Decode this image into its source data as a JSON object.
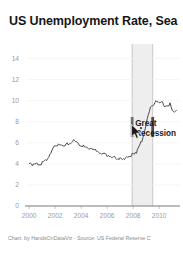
{
  "chart_title": "US Unemployment Rate, Sea",
  "footer": "Chart: by HandsOnDataViz · Source: US Federal Reserve C",
  "cursor": {
    "icon": "mouse-pointer-icon",
    "x": 131,
    "y": 124
  },
  "chart_data": {
    "type": "line",
    "title": "US Unemployment Rate, Sea",
    "xlabel": "",
    "ylabel": "",
    "xlim": [
      1999.6,
      2011.6
    ],
    "ylim": [
      0,
      15
    ],
    "grid": false,
    "legend": null,
    "x_ticks": [
      "2000",
      "2002",
      "2004",
      "2006",
      "2008",
      "2010"
    ],
    "x_tick_values": [
      2000,
      2002,
      2004,
      2006,
      2008,
      2010
    ],
    "y_ticks": [
      "0",
      "2",
      "4",
      "6",
      "8",
      "10",
      "12",
      "14"
    ],
    "y_tick_values": [
      0,
      2,
      4,
      6,
      8,
      10,
      12,
      14
    ],
    "annotations": [
      {
        "name": "great-recession-band",
        "label": "Great\nRecession",
        "label_line1": "Great",
        "label_line2": "Recession",
        "x_start": 2007.92,
        "x_end": 2009.5,
        "fill": "#eeeeee",
        "border": "#aaaaaa"
      }
    ],
    "handles": [
      {
        "name": "band-left-handle",
        "x": 2007.92,
        "y": 7.5,
        "color": "#6f6f6f"
      },
      {
        "name": "band-right-handle",
        "x": 2009.5,
        "y": 7.5,
        "color": "#4a4a4a"
      }
    ],
    "marker_dot": {
      "x": 2008.6,
      "y": 7.4,
      "color": "#3a3a3a"
    },
    "series": [
      {
        "name": "US Unemployment Rate",
        "color": "#4d4d4d",
        "x": [
          2000.0,
          2000.08,
          2000.17,
          2000.25,
          2000.33,
          2000.42,
          2000.5,
          2000.58,
          2000.67,
          2000.75,
          2000.83,
          2000.92,
          2001.0,
          2001.08,
          2001.17,
          2001.25,
          2001.33,
          2001.42,
          2001.5,
          2001.58,
          2001.67,
          2001.75,
          2001.83,
          2001.92,
          2002.0,
          2002.08,
          2002.17,
          2002.25,
          2002.33,
          2002.42,
          2002.5,
          2002.58,
          2002.67,
          2002.75,
          2002.83,
          2002.92,
          2003.0,
          2003.08,
          2003.17,
          2003.25,
          2003.33,
          2003.42,
          2003.5,
          2003.58,
          2003.67,
          2003.75,
          2003.83,
          2003.92,
          2004.0,
          2004.08,
          2004.17,
          2004.25,
          2004.33,
          2004.42,
          2004.5,
          2004.58,
          2004.67,
          2004.75,
          2004.83,
          2004.92,
          2005.0,
          2005.08,
          2005.17,
          2005.25,
          2005.33,
          2005.42,
          2005.5,
          2005.58,
          2005.67,
          2005.75,
          2005.83,
          2005.92,
          2006.0,
          2006.08,
          2006.17,
          2006.25,
          2006.33,
          2006.42,
          2006.5,
          2006.58,
          2006.67,
          2006.75,
          2006.83,
          2006.92,
          2007.0,
          2007.08,
          2007.17,
          2007.25,
          2007.33,
          2007.42,
          2007.5,
          2007.58,
          2007.67,
          2007.75,
          2007.83,
          2007.92,
          2008.0,
          2008.08,
          2008.17,
          2008.25,
          2008.33,
          2008.42,
          2008.5,
          2008.58,
          2008.67,
          2008.75,
          2008.83,
          2008.92,
          2009.0,
          2009.08,
          2009.17,
          2009.25,
          2009.33,
          2009.42,
          2009.5,
          2009.58,
          2009.67,
          2009.75,
          2009.83,
          2009.92,
          2010.0,
          2010.08,
          2010.17,
          2010.25,
          2010.33,
          2010.42,
          2010.5,
          2010.58,
          2010.67,
          2010.75,
          2010.83,
          2010.92,
          2011.0,
          2011.08,
          2011.17,
          2011.25,
          2011.33
        ],
        "y": [
          4.0,
          4.1,
          4.0,
          3.8,
          4.0,
          4.0,
          4.0,
          4.1,
          3.9,
          3.9,
          3.9,
          3.9,
          4.2,
          4.2,
          4.3,
          4.4,
          4.3,
          4.5,
          4.6,
          4.9,
          5.0,
          5.3,
          5.5,
          5.7,
          5.7,
          5.7,
          5.7,
          5.9,
          5.8,
          5.8,
          5.8,
          5.7,
          5.7,
          5.7,
          5.9,
          6.0,
          5.8,
          5.9,
          5.9,
          6.0,
          6.1,
          6.3,
          6.2,
          6.1,
          6.1,
          6.0,
          5.8,
          5.7,
          5.7,
          5.6,
          5.8,
          5.6,
          5.6,
          5.6,
          5.5,
          5.4,
          5.4,
          5.5,
          5.4,
          5.4,
          5.3,
          5.4,
          5.2,
          5.2,
          5.1,
          5.0,
          5.0,
          4.9,
          5.0,
          5.0,
          5.0,
          4.9,
          4.7,
          4.8,
          4.7,
          4.7,
          4.6,
          4.6,
          4.7,
          4.7,
          4.5,
          4.4,
          4.5,
          4.4,
          4.6,
          4.5,
          4.4,
          4.5,
          4.4,
          4.6,
          4.7,
          4.6,
          4.7,
          4.7,
          4.7,
          5.0,
          5.0,
          4.9,
          5.1,
          5.0,
          5.4,
          5.6,
          5.8,
          6.1,
          6.1,
          6.5,
          6.8,
          7.3,
          7.8,
          8.3,
          8.7,
          9.0,
          9.4,
          9.5,
          9.5,
          9.6,
          9.8,
          10.0,
          9.9,
          9.9,
          9.8,
          9.8,
          9.9,
          9.9,
          9.6,
          9.4,
          9.5,
          9.5,
          9.5,
          9.5,
          9.8,
          9.4,
          9.1,
          9.0,
          8.9,
          9.0,
          9.1
        ]
      }
    ]
  }
}
